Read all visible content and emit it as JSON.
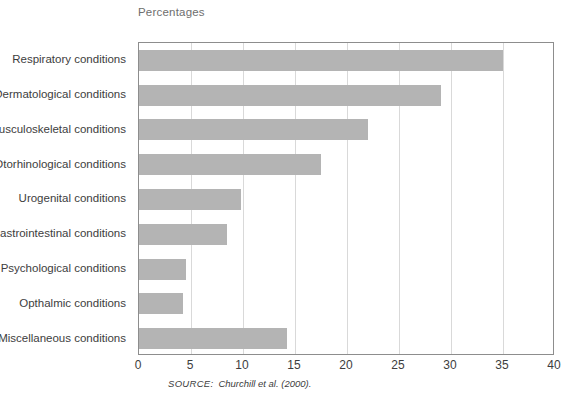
{
  "chart_data": {
    "type": "bar",
    "orientation": "horizontal",
    "title": "Percentages",
    "xlabel": "",
    "ylabel": "",
    "xlim": [
      0,
      40
    ],
    "xticks": [
      0,
      5,
      10,
      15,
      20,
      25,
      30,
      35,
      40
    ],
    "grid": true,
    "legend": null,
    "bar_color": "#b4b4b4",
    "categories": [
      "Respiratory conditions",
      "Dermatological conditions",
      "Musculoskeletal conditions",
      "Otorhinological conditions",
      "Urogenital conditions",
      "Gastrointestinal conditions",
      "Psychological conditions",
      "Opthalmic conditions",
      "Miscellaneous conditions"
    ],
    "values": [
      35,
      29,
      22,
      17.5,
      9.8,
      8.5,
      4.5,
      4.2,
      14.2
    ],
    "source": {
      "label": "SOURCE:",
      "text": "Churchill et al. (2000)."
    }
  }
}
